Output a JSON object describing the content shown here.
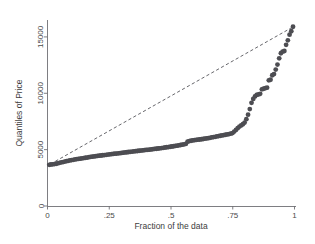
{
  "chart_data": {
    "type": "scatter",
    "title": "",
    "xlabel": "Fraction of the data",
    "ylabel": "Quantiles of Price",
    "xlim": [
      0,
      1
    ],
    "ylim": [
      0,
      16500
    ],
    "grid": false,
    "legend": null,
    "xticks": [
      0,
      0.25,
      0.5,
      0.75,
      1
    ],
    "xticklabels": [
      "0",
      ".25",
      ".5",
      ".75",
      "1"
    ],
    "yticks": [
      0,
      5000,
      10000,
      15000
    ],
    "yticklabels": [
      "0",
      "5000",
      "10000",
      "15000"
    ],
    "marker_color": "#4d4d52",
    "marker_size": 2.4,
    "reference_line": {
      "style": "dashed",
      "color": "#55555a",
      "x": [
        0.012,
        0.995
      ],
      "y": [
        3720,
        15900
      ]
    },
    "series": [
      {
        "name": "Quantiles of Price",
        "x": [
          0.007,
          0.014,
          0.021,
          0.028,
          0.035,
          0.042,
          0.049,
          0.056,
          0.063,
          0.07,
          0.077,
          0.084,
          0.091,
          0.098,
          0.105,
          0.112,
          0.119,
          0.126,
          0.133,
          0.14,
          0.147,
          0.154,
          0.161,
          0.168,
          0.175,
          0.182,
          0.189,
          0.196,
          0.203,
          0.21,
          0.217,
          0.224,
          0.231,
          0.238,
          0.245,
          0.252,
          0.259,
          0.266,
          0.273,
          0.28,
          0.287,
          0.294,
          0.301,
          0.308,
          0.315,
          0.322,
          0.329,
          0.336,
          0.343,
          0.35,
          0.357,
          0.364,
          0.371,
          0.378,
          0.385,
          0.392,
          0.399,
          0.406,
          0.413,
          0.42,
          0.427,
          0.434,
          0.441,
          0.448,
          0.455,
          0.462,
          0.469,
          0.476,
          0.483,
          0.49,
          0.497,
          0.504,
          0.511,
          0.518,
          0.525,
          0.532,
          0.539,
          0.546,
          0.553,
          0.56,
          0.567,
          0.574,
          0.581,
          0.588,
          0.595,
          0.602,
          0.609,
          0.616,
          0.623,
          0.63,
          0.637,
          0.644,
          0.651,
          0.658,
          0.665,
          0.672,
          0.679,
          0.686,
          0.693,
          0.7,
          0.707,
          0.714,
          0.721,
          0.728,
          0.735,
          0.742,
          0.749,
          0.756,
          0.763,
          0.77,
          0.777,
          0.784,
          0.791,
          0.798,
          0.805,
          0.812,
          0.819,
          0.826,
          0.833,
          0.84,
          0.847,
          0.854,
          0.861,
          0.868,
          0.875,
          0.882,
          0.889,
          0.896,
          0.903,
          0.91,
          0.917,
          0.924,
          0.931,
          0.938,
          0.945,
          0.952,
          0.959,
          0.966,
          0.973,
          0.98,
          0.987,
          0.994
        ],
        "y": [
          3650,
          3680,
          3700,
          3720,
          3750,
          3790,
          3830,
          3870,
          3900,
          3940,
          3980,
          4010,
          4040,
          4070,
          4100,
          4130,
          4160,
          4180,
          4200,
          4230,
          4250,
          4280,
          4300,
          4330,
          4360,
          4380,
          4400,
          4420,
          4440,
          4460,
          4480,
          4500,
          4520,
          4540,
          4560,
          4580,
          4600,
          4620,
          4640,
          4655,
          4670,
          4690,
          4710,
          4730,
          4750,
          4770,
          4790,
          4810,
          4825,
          4840,
          4860,
          4880,
          4900,
          4915,
          4930,
          4950,
          4970,
          4985,
          5000,
          5020,
          5040,
          5060,
          5080,
          5100,
          5120,
          5140,
          5165,
          5190,
          5210,
          5230,
          5255,
          5280,
          5300,
          5325,
          5350,
          5380,
          5410,
          5440,
          5470,
          5510,
          5700,
          5760,
          5790,
          5820,
          5840,
          5860,
          5880,
          5900,
          5920,
          5945,
          5970,
          5995,
          6020,
          6050,
          6080,
          6110,
          6140,
          6170,
          6200,
          6230,
          6260,
          6290,
          6320,
          6350,
          6380,
          6420,
          6470,
          6600,
          6750,
          6900,
          7050,
          7150,
          7250,
          7400,
          7700,
          8100,
          8600,
          9150,
          9500,
          9720,
          9850,
          9900,
          9950,
          10350,
          10400,
          10450,
          10500,
          11150,
          11200,
          11600,
          11700,
          12100,
          12550,
          13100,
          13550,
          13700,
          13750,
          14300,
          14700,
          15200,
          15500,
          15900
        ]
      }
    ]
  }
}
